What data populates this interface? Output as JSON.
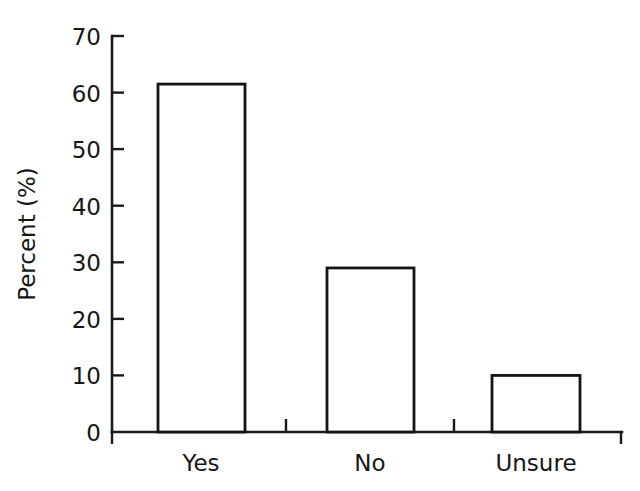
{
  "chart_data": {
    "type": "bar",
    "title": "",
    "subtitle": "",
    "xlabel": "",
    "ylabel": "Percent (%)",
    "categories": [
      "Yes",
      "No",
      "Unsure"
    ],
    "values": [
      61.5,
      29,
      10
    ],
    "series": [
      {
        "name": "Percent",
        "values": [
          61.5,
          29,
          10
        ]
      }
    ],
    "ylim": [
      0,
      70
    ],
    "xlim": [
      0,
      3
    ],
    "y_ticks": [
      0,
      10,
      20,
      30,
      40,
      50,
      60,
      70
    ],
    "y_tick_labels": [
      "0",
      "10",
      "20",
      "30",
      "40",
      "50",
      "60",
      "70"
    ],
    "grid": false,
    "legend": false,
    "legend_position": "none",
    "bar_fill_color": "#ffffff",
    "bar_edge_color": "#141414",
    "axis_color": "#1a1a1a",
    "background_color": "#ffffff",
    "annotations": []
  },
  "axes": {
    "y_axis_title": "Percent (%)",
    "y_tick_labels": [
      "70",
      "60",
      "50",
      "40",
      "30",
      "20",
      "10",
      "0"
    ],
    "x_tick_labels": [
      "Yes",
      "No",
      "Unsure"
    ]
  }
}
